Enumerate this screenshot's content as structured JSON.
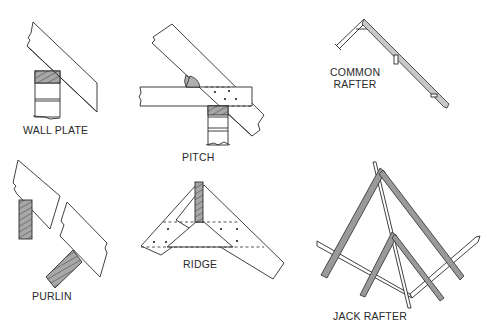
{
  "figure": {
    "colors": {
      "line": "#2b2b2b",
      "hatch_fill": "#a8a8a8",
      "timber_grey": "#9a9a9a",
      "background": "#ffffff"
    },
    "panels": [
      {
        "id": "wall-plate",
        "label": "WALL PLATE"
      },
      {
        "id": "pitch",
        "label": "PITCH"
      },
      {
        "id": "common-rafter",
        "label_line1": "COMMON",
        "label_line2": "RAFTER"
      },
      {
        "id": "purlin",
        "label": "PURLIN"
      },
      {
        "id": "ridge",
        "label": "RIDGE"
      },
      {
        "id": "jack-rafter",
        "label": "JACK RAFTER"
      }
    ]
  }
}
